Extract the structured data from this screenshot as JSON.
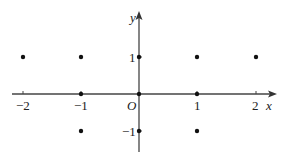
{
  "diagram": {
    "type": "coordinate-plane-points",
    "axes": {
      "x_label": "x",
      "y_label": "y",
      "origin_label": "O",
      "x_ticks": [
        {
          "value": -2,
          "label": "−2"
        },
        {
          "value": -1,
          "label": "−1"
        },
        {
          "value": 1,
          "label": "1"
        },
        {
          "value": 2,
          "label": "2"
        }
      ],
      "y_ticks": [
        {
          "value": 1,
          "label": "1"
        },
        {
          "value": -1,
          "label": "−1"
        }
      ]
    },
    "points": [
      {
        "x": -2,
        "y": 1
      },
      {
        "x": -1,
        "y": 1
      },
      {
        "x": 0,
        "y": 1
      },
      {
        "x": 1,
        "y": 1
      },
      {
        "x": 2,
        "y": 1
      },
      {
        "x": -1,
        "y": 0
      },
      {
        "x": 0,
        "y": 0
      },
      {
        "x": 1,
        "y": 0
      },
      {
        "x": -1,
        "y": -1
      },
      {
        "x": 0,
        "y": -1
      },
      {
        "x": 1,
        "y": -1
      }
    ],
    "colors": {
      "axis": "#444444",
      "point": "#111111",
      "text": "#222222"
    }
  }
}
